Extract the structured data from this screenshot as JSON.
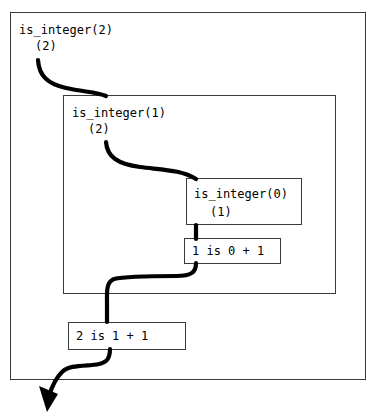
{
  "figure": {
    "clipped_caption": "solution.",
    "type": "recursion-trace-diagram",
    "ink_color": "#000000",
    "frame_color": "#3a3a3a",
    "background": "#ffffff"
  },
  "frames": [
    {
      "id": "frame-outer",
      "call_label": "is_integer(2)",
      "return_label": "(2)",
      "depth": 0
    },
    {
      "id": "frame-mid",
      "call_label": "is_integer(1)",
      "return_label": "(2)",
      "depth": 1
    },
    {
      "id": "frame-inner",
      "call_label": "is_integer(0)",
      "return_label": "(1)",
      "depth": 2
    }
  ],
  "results": [
    {
      "id": "result-inner",
      "text": "1 is 0 + 1"
    },
    {
      "id": "result-outer",
      "text": "2 is 1 + 1"
    }
  ],
  "arrows": [
    {
      "id": "call-arrow-2-to-1",
      "kind": "call",
      "from": "is_integer(2)",
      "to": "is_integer(1)"
    },
    {
      "id": "call-arrow-1-to-0",
      "kind": "call",
      "from": "is_integer(1)",
      "to": "is_integer(0)"
    },
    {
      "id": "return-arrow-inner",
      "kind": "return",
      "from": "1 is 0 + 1",
      "to": "2 is 1 + 1"
    },
    {
      "id": "return-arrow-final",
      "kind": "return",
      "from": "2 is 1 + 1",
      "to": "caller",
      "has_arrowhead": true
    }
  ]
}
